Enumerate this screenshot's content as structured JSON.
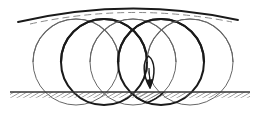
{
  "figure": {
    "width": 257,
    "height": 133,
    "background_color": "#ffffff",
    "ink_color": "#1a1a1a",
    "thin_color": "#4d4d4d",
    "hatch_color": "#555555"
  },
  "ground": {
    "label": "ground-line",
    "y": 92,
    "x_start": 10,
    "x_end": 250,
    "line_color": "#333333",
    "line_width": 1.6,
    "hatch_band_height": 6,
    "hatch_color": "#666666",
    "hatch_spacing": 3,
    "hatch_angle_deg": 60
  },
  "circles": [
    {
      "name": "circle-1",
      "cx": 76,
      "cy": 62,
      "r": 43,
      "stroke_width": 0.9,
      "stroke": "#555555",
      "style": "thin"
    },
    {
      "name": "circle-2",
      "cx": 104,
      "cy": 62,
      "r": 43,
      "stroke_width": 2.0,
      "stroke": "#1a1a1a",
      "style": "thick"
    },
    {
      "name": "circle-3",
      "cx": 133,
      "cy": 62,
      "r": 43,
      "stroke_width": 0.9,
      "stroke": "#555555",
      "style": "thin"
    },
    {
      "name": "circle-4",
      "cx": 161,
      "cy": 62,
      "r": 43,
      "stroke_width": 2.0,
      "stroke": "#1a1a1a",
      "style": "thick"
    },
    {
      "name": "circle-5",
      "cx": 190,
      "cy": 62,
      "r": 43,
      "stroke_width": 0.9,
      "stroke": "#555555",
      "style": "thin"
    }
  ],
  "top_arcs": [
    {
      "name": "arc-1",
      "cx": 76,
      "cy": 62,
      "r": 43,
      "stroke_width": 1.2,
      "stroke": "#666666"
    },
    {
      "name": "arc-2",
      "cx": 104,
      "cy": 62,
      "r": 43,
      "stroke_width": 2.2,
      "stroke": "#1a1a1a"
    },
    {
      "name": "arc-3",
      "cx": 133,
      "cy": 62,
      "r": 43,
      "stroke_width": 1.2,
      "stroke": "#666666"
    },
    {
      "name": "arc-4",
      "cx": 161,
      "cy": 62,
      "r": 43,
      "stroke_width": 2.2,
      "stroke": "#1a1a1a"
    },
    {
      "name": "arc-5",
      "cx": 190,
      "cy": 62,
      "r": 43,
      "stroke_width": 1.2,
      "stroke": "#666666"
    }
  ],
  "envelope_curve": {
    "name": "envelope-arc",
    "description": "long shallow arc across the top of the circle family",
    "stroke": "#1a1a1a",
    "stroke_width": 1.8,
    "path": "M 18,22 Q 130,-4 238,20"
  },
  "envelope_curve_secondary": {
    "name": "envelope-arc-secondary",
    "description": "lighter dashed companion arc slightly below the main envelope",
    "stroke": "#8a8a8a",
    "stroke_width": 1.0,
    "dash": "7 4",
    "path": "M 30,24 Q 130,2 232,22"
  },
  "hatched_region": {
    "name": "hatched-lens-region",
    "description": "lens-shaped overlap of two circles lying below the ground line",
    "fill_hatch_color": "#4d4d4d",
    "outline_color": "#1a1a1a",
    "outline_width": 1.6,
    "hatch_spacing": 3,
    "hatch_angle_deg": 60
  },
  "arrow": {
    "name": "velocity-arrow",
    "description": "narrow vertical loop with arrowhead pointing downward toward the ground line",
    "color": "#1a1a1a",
    "stroke_width": 1.5,
    "tip_x": 150,
    "tip_y": 88,
    "loop_top_y": 56,
    "loop_half_width": 5
  },
  "annotations": {
    "ground_label": "",
    "arrow_label": "",
    "figure_caption": ""
  }
}
